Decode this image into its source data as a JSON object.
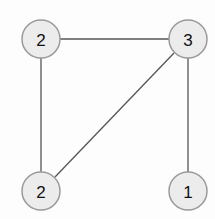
{
  "graph": {
    "nodes": [
      {
        "id": "n1",
        "label": "2",
        "x": 41,
        "y": 39
      },
      {
        "id": "n2",
        "label": "3",
        "x": 188,
        "y": 39
      },
      {
        "id": "n3",
        "label": "2",
        "x": 41,
        "y": 191
      },
      {
        "id": "n4",
        "label": "1",
        "x": 188,
        "y": 191
      }
    ],
    "edges": [
      {
        "from": "n1",
        "to": "n2"
      },
      {
        "from": "n1",
        "to": "n3"
      },
      {
        "from": "n2",
        "to": "n3"
      },
      {
        "from": "n2",
        "to": "n4"
      }
    ],
    "node_radius": 19,
    "colors": {
      "node_fill": "#ececec",
      "node_stroke": "#9a9a9a",
      "edge": "#555555"
    }
  }
}
